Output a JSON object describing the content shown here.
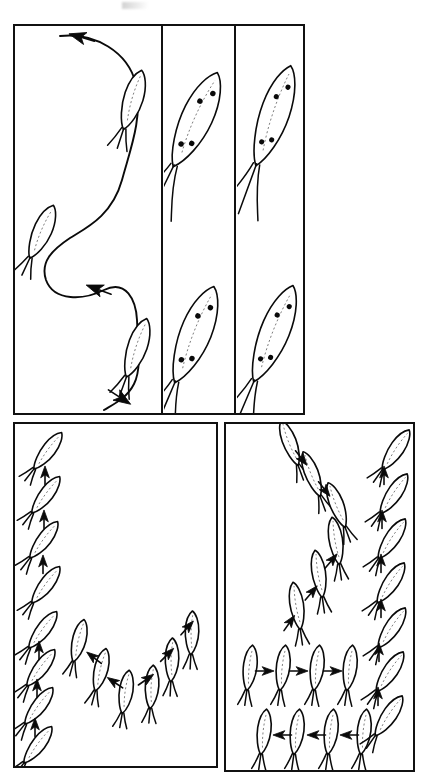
{
  "figure": {
    "medium": "black-ink line drawing on white",
    "panel_count": 4,
    "organism_label": "larva",
    "ink_color": "#0a0a0a",
    "background_color": "#ffffff",
    "midline_color": "#6d6d6d"
  },
  "panels": [
    {
      "id": "panel-a",
      "name": "top-left-trajectory",
      "caption": "Sinuous S-shaped swimming trajectory with three larvae along the path",
      "x": 13,
      "y": 24,
      "w": 148,
      "h": 391,
      "larva_count": 3,
      "arrow_count": 3,
      "path_type": "sinusoidal",
      "larvae": [
        {
          "cx": 133,
          "cy": 100,
          "angle": 198,
          "len": 62,
          "wid": 20,
          "spots": 0,
          "tails": 3
        },
        {
          "cx": 42,
          "cy": 232,
          "angle": 205,
          "len": 58,
          "wid": 19,
          "spots": 0,
          "tails": 3
        },
        {
          "cx": 137,
          "cy": 348,
          "angle": 200,
          "len": 62,
          "wid": 20,
          "spots": 0,
          "tails": 3
        }
      ],
      "arrows": [
        {
          "x": 80,
          "y": 37,
          "angle": 196
        },
        {
          "x": 97,
          "y": 289,
          "angle": 200
        },
        {
          "x": 121,
          "y": 398,
          "angle": 33
        }
      ]
    },
    {
      "id": "panel-b",
      "name": "top-middle-detail",
      "caption": "Two detailed larvae showing paired antennae, four pigment spots and gut midline",
      "x": 163,
      "y": 24,
      "w": 71,
      "h": 391,
      "larva_count": 2,
      "larvae": [
        {
          "cx": 196,
          "cy": 120,
          "angle": 206,
          "len": 104,
          "wid": 32,
          "spots": 4,
          "tails": 3
        },
        {
          "cx": 195,
          "cy": 335,
          "angle": 203,
          "len": 104,
          "wid": 32,
          "spots": 4,
          "tails": 3
        }
      ]
    },
    {
      "id": "panel-c",
      "name": "top-right-detail",
      "caption": "Two detailed larvae with elongated antennae and four pigment spots",
      "x": 236,
      "y": 24,
      "w": 69,
      "h": 391,
      "larva_count": 2,
      "larvae": [
        {
          "cx": 274,
          "cy": 116,
          "angle": 200,
          "len": 106,
          "wid": 30,
          "spots": 4,
          "tails": 3
        },
        {
          "cx": 274,
          "cy": 334,
          "angle": 203,
          "len": 104,
          "wid": 30,
          "spots": 4,
          "tails": 3
        }
      ]
    },
    {
      "id": "panel-d",
      "name": "bottom-left-u-sequence",
      "caption": "U-shaped sequence: larvae ascending the left column, descending into a trough and ascending the right side",
      "x": 13,
      "y": 422,
      "w": 205,
      "h": 346,
      "larva_count": 14,
      "arrow_count": 11,
      "path_type": "u-shaped"
    },
    {
      "id": "panel-e",
      "name": "bottom-right-zigzag-sequence",
      "caption": "Zig-zag sequence: larvae descending diagonally, traversing rightward and leftward rows, and ascending the right column",
      "x": 224,
      "y": 422,
      "w": 191,
      "h": 350,
      "larva_count": 19,
      "arrow_count": 15,
      "path_type": "zigzag"
    }
  ],
  "panel_d_items": {
    "left_column": [
      {
        "cx": 48,
        "cy": 451,
        "angle": 218,
        "len": 46,
        "wid": 14
      },
      {
        "cx": 46,
        "cy": 495,
        "angle": 218,
        "len": 46,
        "wid": 14
      },
      {
        "cx": 44,
        "cy": 540,
        "angle": 218,
        "len": 46,
        "wid": 14
      },
      {
        "cx": 46,
        "cy": 585,
        "angle": 218,
        "len": 46,
        "wid": 14
      },
      {
        "cx": 43,
        "cy": 630,
        "angle": 218,
        "len": 46,
        "wid": 14
      },
      {
        "cx": 41,
        "cy": 668,
        "angle": 218,
        "len": 46,
        "wid": 14
      },
      {
        "cx": 39,
        "cy": 706,
        "angle": 218,
        "len": 46,
        "wid": 14
      },
      {
        "cx": 38,
        "cy": 745,
        "angle": 218,
        "len": 46,
        "wid": 14
      }
    ],
    "left_arrows": [
      {
        "x": 45,
        "y": 474,
        "angle": -90
      },
      {
        "x": 44,
        "y": 518,
        "angle": -90
      },
      {
        "x": 43,
        "y": 563,
        "angle": -90
      },
      {
        "x": 39,
        "y": 649,
        "angle": -90
      },
      {
        "x": 37,
        "y": 687,
        "angle": -90
      },
      {
        "x": 35,
        "y": 726,
        "angle": -90
      }
    ],
    "trough": [
      {
        "cx": 79,
        "cy": 641,
        "angle": 195,
        "len": 44,
        "wid": 14
      },
      {
        "cx": 101,
        "cy": 670,
        "angle": 195,
        "len": 44,
        "wid": 14
      },
      {
        "cx": 126,
        "cy": 692,
        "angle": 190,
        "len": 44,
        "wid": 14
      },
      {
        "cx": 152,
        "cy": 687,
        "angle": 185,
        "len": 44,
        "wid": 14
      },
      {
        "cx": 172,
        "cy": 660,
        "angle": 183,
        "len": 44,
        "wid": 14
      },
      {
        "cx": 192,
        "cy": 633,
        "angle": 183,
        "len": 44,
        "wid": 14
      }
    ],
    "trough_arrows": [
      {
        "x": 93,
        "y": 657,
        "angle": 218
      },
      {
        "x": 114,
        "y": 682,
        "angle": 214
      },
      {
        "x": 147,
        "y": 679,
        "angle": -35
      },
      {
        "x": 168,
        "y": 654,
        "angle": -45
      },
      {
        "x": 188,
        "y": 627,
        "angle": -48
      }
    ]
  },
  "panel_e_items": {
    "descending": [
      {
        "cx": 290,
        "cy": 443,
        "angle": 160,
        "len": 48,
        "wid": 14
      },
      {
        "cx": 312,
        "cy": 474,
        "angle": 160,
        "len": 48,
        "wid": 14
      },
      {
        "cx": 337,
        "cy": 505,
        "angle": 160,
        "len": 48,
        "wid": 14
      },
      {
        "cx": 336,
        "cy": 541,
        "angle": 172,
        "len": 48,
        "wid": 14
      },
      {
        "cx": 319,
        "cy": 574,
        "angle": 172,
        "len": 48,
        "wid": 14
      },
      {
        "cx": 297,
        "cy": 606,
        "angle": 172,
        "len": 48,
        "wid": 14
      }
    ],
    "descending_arrows": [
      {
        "x": 302,
        "y": 459,
        "angle": 52
      },
      {
        "x": 325,
        "y": 490,
        "angle": 52
      },
      {
        "x": 332,
        "y": 560,
        "angle": -50
      },
      {
        "x": 312,
        "y": 592,
        "angle": -50
      },
      {
        "x": 290,
        "y": 622,
        "angle": -55
      }
    ],
    "row_right": [
      {
        "cx": 250,
        "cy": 668,
        "angle": 188,
        "len": 46,
        "wid": 14
      },
      {
        "cx": 283,
        "cy": 668,
        "angle": 188,
        "len": 46,
        "wid": 14
      },
      {
        "cx": 317,
        "cy": 668,
        "angle": 188,
        "len": 46,
        "wid": 14
      },
      {
        "cx": 350,
        "cy": 668,
        "angle": 188,
        "len": 46,
        "wid": 14
      }
    ],
    "row_right_arrows": [
      {
        "x": 266,
        "y": 671,
        "angle": 0
      },
      {
        "x": 300,
        "y": 671,
        "angle": 0
      },
      {
        "x": 334,
        "y": 671,
        "angle": 0
      }
    ],
    "row_left": [
      {
        "cx": 264,
        "cy": 732,
        "angle": 188,
        "len": 46,
        "wid": 14
      },
      {
        "cx": 297,
        "cy": 732,
        "angle": 188,
        "len": 46,
        "wid": 14
      },
      {
        "cx": 331,
        "cy": 732,
        "angle": 188,
        "len": 46,
        "wid": 14
      },
      {
        "cx": 364,
        "cy": 732,
        "angle": 188,
        "len": 46,
        "wid": 14
      }
    ],
    "row_left_arrows": [
      {
        "x": 281,
        "y": 735,
        "angle": 180
      },
      {
        "x": 315,
        "y": 735,
        "angle": 180
      },
      {
        "x": 348,
        "y": 735,
        "angle": 180
      }
    ],
    "right_column": [
      {
        "cx": 396,
        "cy": 450,
        "angle": 215,
        "len": 48,
        "wid": 15
      },
      {
        "cx": 394,
        "cy": 494,
        "angle": 215,
        "len": 48,
        "wid": 15
      },
      {
        "cx": 392,
        "cy": 539,
        "angle": 215,
        "len": 48,
        "wid": 15
      },
      {
        "cx": 391,
        "cy": 583,
        "angle": 215,
        "len": 48,
        "wid": 15
      },
      {
        "cx": 392,
        "cy": 628,
        "angle": 215,
        "len": 48,
        "wid": 15
      },
      {
        "cx": 390,
        "cy": 672,
        "angle": 215,
        "len": 48,
        "wid": 15
      },
      {
        "cx": 389,
        "cy": 716,
        "angle": 215,
        "len": 48,
        "wid": 15
      }
    ],
    "right_arrows": [
      {
        "x": 384,
        "y": 474,
        "angle": -90
      },
      {
        "x": 382,
        "y": 518,
        "angle": -90
      },
      {
        "x": 381,
        "y": 562,
        "angle": -90
      },
      {
        "x": 381,
        "y": 607,
        "angle": -90
      },
      {
        "x": 379,
        "y": 651,
        "angle": -90
      },
      {
        "x": 378,
        "y": 695,
        "angle": -90
      }
    ]
  }
}
